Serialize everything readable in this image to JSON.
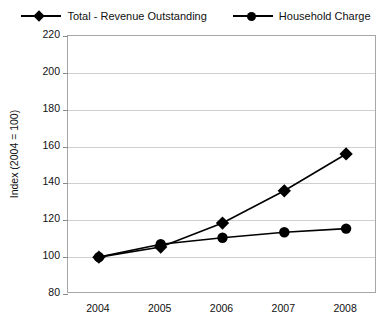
{
  "legend": {
    "entries": [
      {
        "label": "Total - Revenue Outstanding",
        "marker": "diamond-marker-icon",
        "color": "#000000"
      },
      {
        "label": "Household Charge",
        "marker": "circle-marker-icon",
        "color": "#000000"
      }
    ]
  },
  "axes": {
    "ylabel": "Index (2004 = 100)",
    "yticks": [
      "220",
      "200",
      "180",
      "160",
      "140",
      "120",
      "100",
      "80"
    ],
    "xticks": [
      "2004",
      "2005",
      "2006",
      "2007",
      "2008"
    ]
  },
  "chart_data": {
    "type": "line",
    "title": "",
    "xlabel": "",
    "ylabel": "Index (2004 = 100)",
    "categories": [
      "2004",
      "2005",
      "2006",
      "2007",
      "2008"
    ],
    "x": [
      2004,
      2005,
      2006,
      2007,
      2008
    ],
    "ylim": [
      80,
      220
    ],
    "ytick_step": 20,
    "grid": true,
    "legend_position": "top",
    "series": [
      {
        "name": "Total - Revenue Outstanding",
        "marker": "diamond",
        "color": "#000000",
        "values": [
          100,
          105.5,
          118.5,
          136,
          156
        ]
      },
      {
        "name": "Household Charge",
        "marker": "circle",
        "color": "#000000",
        "values": [
          100,
          107,
          110.5,
          113.5,
          115.5
        ]
      }
    ]
  }
}
